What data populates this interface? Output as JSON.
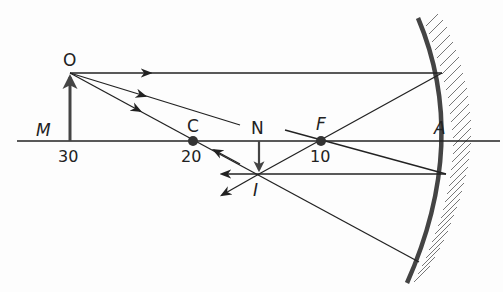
{
  "diagram": {
    "type": "concave-mirror-ray-diagram",
    "colors": {
      "ink": "#222222",
      "mirror": "#444444",
      "hatch": "#666666",
      "background": "#fdfdfd"
    },
    "labels": {
      "object_top": "O",
      "object_base": "M",
      "center": "C",
      "focus": "F",
      "image_base": "N",
      "image_top": "I",
      "vertex": "A"
    },
    "axis_values": {
      "object_position": "30",
      "center_position": "20",
      "focus_position": "10"
    },
    "points": {
      "O": [
        70,
        73
      ],
      "M": [
        70,
        141
      ],
      "C": [
        193,
        141
      ],
      "F": [
        321,
        141
      ],
      "N": [
        259,
        141
      ],
      "I": [
        259,
        174
      ],
      "A": [
        453,
        141
      ]
    },
    "rays": [
      {
        "name": "parallel-ray",
        "path": [
          [
            70,
            73
          ],
          [
            442,
            73
          ],
          [
            321,
            141
          ],
          [
            259,
            174
          ],
          [
            224,
            193
          ]
        ]
      },
      {
        "name": "focal-ray",
        "path": [
          [
            70,
            73
          ],
          [
            446,
            174
          ],
          [
            222,
            174
          ]
        ]
      },
      {
        "name": "center-ray",
        "path": [
          [
            70,
            73
          ],
          [
            419,
            262
          ]
        ],
        "reflected_back_arrow": [
          [
            230,
            160
          ],
          [
            214,
            151
          ]
        ]
      }
    ]
  }
}
